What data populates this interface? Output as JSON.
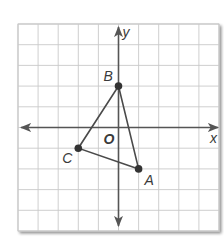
{
  "figure": {
    "type": "coordinate-plane",
    "grid": {
      "columns": 10,
      "rows": 10,
      "x_range": [
        -5,
        5
      ],
      "y_range": [
        -5,
        5
      ],
      "grid_color": "#c9c9c9",
      "axis_color": "#555555"
    },
    "axes": {
      "x_label": "x",
      "y_label": "y",
      "origin_label": "O"
    },
    "triangle": {
      "edge_color": "#4a4a4a",
      "point_color": "#333333",
      "vertices": [
        {
          "label": "A",
          "x": 1,
          "y": -2
        },
        {
          "label": "B",
          "x": 0,
          "y": 2
        },
        {
          "label": "C",
          "x": -2,
          "y": -1
        }
      ]
    }
  }
}
